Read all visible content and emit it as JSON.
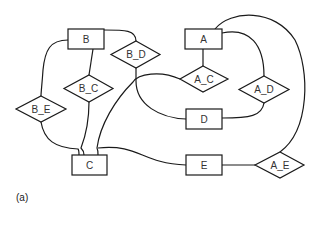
{
  "figure": {
    "caption": "(a)",
    "entities": [
      {
        "id": "A",
        "label": "A"
      },
      {
        "id": "B",
        "label": "B"
      },
      {
        "id": "C",
        "label": "C"
      },
      {
        "id": "D",
        "label": "D"
      },
      {
        "id": "E",
        "label": "E"
      }
    ],
    "relationships": [
      {
        "id": "B_D",
        "label": "B_D",
        "connects": [
          "B",
          "D"
        ]
      },
      {
        "id": "B_C",
        "label": "B_C",
        "connects": [
          "B",
          "C"
        ]
      },
      {
        "id": "B_E",
        "label": "B_E",
        "connects": [
          "B",
          "E"
        ]
      },
      {
        "id": "A_C",
        "label": "A_C",
        "connects": [
          "A",
          "C"
        ]
      },
      {
        "id": "A_D",
        "label": "A_D",
        "connects": [
          "A",
          "D"
        ]
      },
      {
        "id": "A_E",
        "label": "A_E",
        "connects": [
          "A",
          "E"
        ]
      }
    ],
    "colors": {
      "stroke": "#1a1a1a",
      "text": "#333333",
      "background": "#ffffff"
    }
  }
}
